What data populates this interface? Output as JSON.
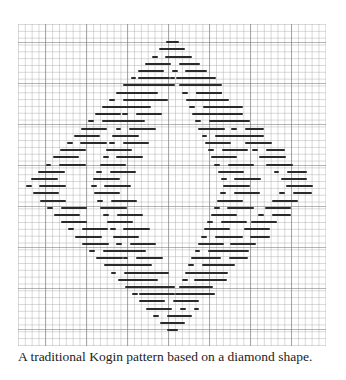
{
  "figure": {
    "grid": {
      "cell_px": 6.83,
      "major_every": 6
    },
    "pattern": {
      "shape": "diamond",
      "center_x": 155,
      "top_y": 10,
      "bottom_y": 311,
      "row_spacing": 7.2,
      "half_width_max": 148
    }
  },
  "caption": "A traditional Kogin pattern based on a diamond shape."
}
